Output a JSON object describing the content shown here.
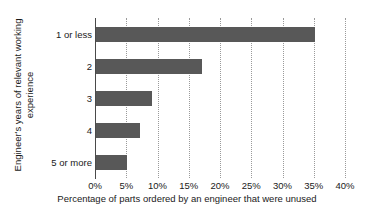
{
  "chart_data": {
    "type": "bar",
    "orientation": "horizontal",
    "title": "",
    "categories": [
      "1 or less",
      "2",
      "3",
      "4",
      "5 or more"
    ],
    "values": [
      35,
      17,
      9,
      7,
      5
    ],
    "xlabel": "Percentage of parts ordered by an engineer that were unused",
    "ylabel": "Engineer's years of relevant working experience",
    "ylabel_line1": "Engineer's years of relevant working",
    "ylabel_line2": "experience",
    "xlim": [
      0,
      40
    ],
    "xticks": [
      0,
      5,
      10,
      15,
      20,
      25,
      30,
      35,
      40
    ],
    "xtick_labels": [
      "0%",
      "5%",
      "10%",
      "15%",
      "20%",
      "25%",
      "30%",
      "35%",
      "40%"
    ],
    "grid": "vertical-dotted",
    "legend": "none",
    "bar_color": "#585858",
    "gridline_color": "#9a9a9a",
    "axis_color": "#4a4a4a",
    "background": "#ffffff"
  }
}
